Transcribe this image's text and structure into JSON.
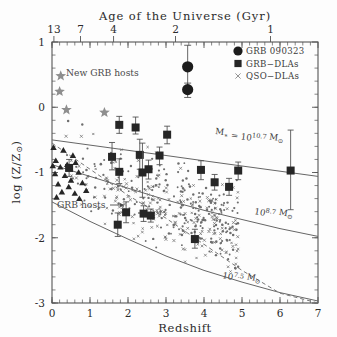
{
  "figure": {
    "top_axis_title": "Age of the Universe (Gyr)",
    "x_axis_label": "Redshift",
    "y_axis_label": "log (Z/Z",
    "y_axis_label_sub": "⊙",
    "y_axis_label_end": ")"
  },
  "legend": {
    "items": [
      {
        "marker": "filled-circle",
        "label": "GRB 090323"
      },
      {
        "marker": "filled-square",
        "label": "GRB−DLAs"
      },
      {
        "marker": "cross",
        "label": "QSO−DLAs"
      }
    ]
  },
  "annotations": [
    {
      "name": "new-grb-hosts-label",
      "text": "New GRB hosts",
      "x": 0.3,
      "y": 0.72
    },
    {
      "name": "grb-hosts-label",
      "text": "GRB hosts",
      "x": 0.1,
      "y": -1.5
    }
  ],
  "curve_labels": [
    {
      "name": "mass-curve-label-high",
      "text": "M",
      "sub": "∗",
      "eq": " = 10",
      "exp": "10.7",
      "unit": " M",
      "unit_sub": "⊙"
    },
    {
      "name": "mass-curve-label-mid",
      "text": "10",
      "exp": "8.7",
      "unit": " M",
      "unit_sub": "⊙"
    },
    {
      "name": "mass-curve-label-low",
      "text": "10",
      "exp": "7.5",
      "unit": " M",
      "unit_sub": "⊙"
    }
  ],
  "chart_data": {
    "type": "scatter",
    "title": "Age of the Universe (Gyr)",
    "xlabel": "Redshift",
    "ylabel": "log (Z/Z⊙)",
    "xlim": [
      0,
      7
    ],
    "ylim": [
      -3,
      1
    ],
    "xticks": [
      0,
      1,
      2,
      3,
      4,
      5,
      6,
      7
    ],
    "yticks": [
      1,
      0,
      -1,
      -2,
      -3
    ],
    "top_axis": {
      "label": "Age of the Universe (Gyr)",
      "ticks": [
        13,
        7,
        4,
        2,
        1
      ],
      "tick_redshift": [
        0.05,
        0.75,
        1.62,
        3.25,
        5.75
      ]
    },
    "grid": false,
    "legend_position": "top-right",
    "series": [
      {
        "name": "GRB 090323",
        "marker": "filled-circle",
        "color": "#1c1c1c",
        "points": [
          {
            "x": 3.57,
            "y": 0.62,
            "yerr_low": 0.3,
            "yerr_high": 0.33
          },
          {
            "x": 3.57,
            "y": 0.27,
            "yerr_low": 0.12,
            "yerr_high": 0.1
          }
        ]
      },
      {
        "name": "GRB−DLAs",
        "marker": "filled-square",
        "color": "#262626",
        "points": [
          {
            "x": 1.77,
            "y": -0.27,
            "yerr_low": 0.13,
            "yerr_high": 0.13
          },
          {
            "x": 2.2,
            "y": -0.31,
            "yerr_low": 0.1,
            "yerr_high": 0.16
          },
          {
            "x": 3.03,
            "y": -0.42,
            "yerr_low": 0.14,
            "yerr_high": 0.13
          },
          {
            "x": 1.58,
            "y": -0.76,
            "yerr_low": 0.2,
            "yerr_high": 0.22
          },
          {
            "x": 2.31,
            "y": -0.73,
            "yerr_low": 0.22,
            "yerr_high": 0.24
          },
          {
            "x": 2.83,
            "y": -0.74,
            "yerr_low": 0.14,
            "yerr_high": 0.13
          },
          {
            "x": 0.45,
            "y": -0.93,
            "yerr_low": 0.13,
            "yerr_high": 0.13
          },
          {
            "x": 1.77,
            "y": -0.99,
            "yerr_low": 0.18,
            "yerr_high": 0.2
          },
          {
            "x": 2.54,
            "y": -0.95,
            "yerr_low": 0.15,
            "yerr_high": 0.14
          },
          {
            "x": 3.92,
            "y": -0.96,
            "yerr_low": 0.15,
            "yerr_high": 0.14
          },
          {
            "x": 4.9,
            "y": -0.97,
            "yerr_low": 0.14,
            "yerr_high": 0.13
          },
          {
            "x": 2.38,
            "y": -1.0,
            "yerr_low": 0.38,
            "yerr_high": 0.45
          },
          {
            "x": 4.28,
            "y": -1.15,
            "yerr_low": 0.12,
            "yerr_high": 0.12
          },
          {
            "x": 4.66,
            "y": -1.22,
            "yerr_low": 0.13,
            "yerr_high": 0.13
          },
          {
            "x": 6.28,
            "y": -0.97,
            "yerr_low": 0.6,
            "yerr_high": 0.62
          },
          {
            "x": 1.95,
            "y": -1.61,
            "yerr_low": 0.16,
            "yerr_high": 0.16
          },
          {
            "x": 2.41,
            "y": -1.63,
            "yerr_low": 0.12,
            "yerr_high": 0.12
          },
          {
            "x": 1.73,
            "y": -1.8,
            "yerr_low": 0.18,
            "yerr_high": 0.18
          },
          {
            "x": 3.76,
            "y": -2.02,
            "yerr_low": 0.14,
            "yerr_high": 0.15
          },
          {
            "x": 2.6,
            "y": -1.66,
            "yerr_low": 0.1,
            "yerr_high": 0.1
          }
        ]
      },
      {
        "name": "New GRB hosts",
        "marker": "star",
        "color": "#8e8e8e",
        "points": [
          {
            "x": 0.23,
            "y": 0.48
          },
          {
            "x": 0.2,
            "y": 0.24
          },
          {
            "x": 0.38,
            "y": -0.04
          },
          {
            "x": 1.38,
            "y": -0.08
          }
        ]
      },
      {
        "name": "GRB hosts",
        "marker": "filled-triangle",
        "color": "#262626",
        "points": [
          {
            "x": 0.04,
            "y": -0.62
          },
          {
            "x": 0.3,
            "y": -0.66
          },
          {
            "x": 0.1,
            "y": -0.82
          },
          {
            "x": 0.55,
            "y": -0.74
          },
          {
            "x": 0.02,
            "y": -0.9
          },
          {
            "x": 0.22,
            "y": -0.92
          },
          {
            "x": 0.4,
            "y": -0.88
          },
          {
            "x": 0.62,
            "y": -0.85
          },
          {
            "x": 0.08,
            "y": -1.02
          },
          {
            "x": 0.34,
            "y": -1.05
          },
          {
            "x": 0.7,
            "y": -1.0
          },
          {
            "x": 0.5,
            "y": -1.12
          },
          {
            "x": 0.16,
            "y": -1.18
          },
          {
            "x": 0.44,
            "y": -1.22
          },
          {
            "x": 0.8,
            "y": -1.16
          },
          {
            "x": 0.26,
            "y": -1.3
          },
          {
            "x": 0.6,
            "y": -1.32
          },
          {
            "x": 0.9,
            "y": -1.28
          },
          {
            "x": 0.12,
            "y": -1.38
          },
          {
            "x": 0.72,
            "y": -1.4
          }
        ]
      },
      {
        "name": "QSO−DLAs",
        "marker": "cross",
        "color": "#707070",
        "note": "dense background scatter of small crosses"
      }
    ],
    "curves": [
      {
        "name": "M* = 10^10.7 Msun",
        "style": "solid",
        "label": "M∗ = 10^{10.7} M⊙",
        "points": [
          [
            0,
            -0.5
          ],
          [
            1,
            -0.58
          ],
          [
            2,
            -0.66
          ],
          [
            3,
            -0.74
          ],
          [
            4,
            -0.82
          ],
          [
            5,
            -0.9
          ],
          [
            6,
            -0.98
          ],
          [
            7,
            -1.06
          ]
        ]
      },
      {
        "name": "M* = 10^8.7 Msun",
        "style": "solid",
        "label": "10^{8.7} M⊙",
        "points": [
          [
            0,
            -0.88
          ],
          [
            1,
            -1.06
          ],
          [
            2,
            -1.24
          ],
          [
            3,
            -1.42
          ],
          [
            4,
            -1.58
          ],
          [
            5,
            -1.72
          ],
          [
            6,
            -1.86
          ],
          [
            7,
            -1.98
          ]
        ]
      },
      {
        "name": "M* = 10^7.5 Msun",
        "style": "solid",
        "label": "10^{7.5} M⊙",
        "points": [
          [
            0,
            -1.45
          ],
          [
            1,
            -1.75
          ],
          [
            2,
            -2.02
          ],
          [
            3,
            -2.28
          ],
          [
            4,
            -2.5
          ],
          [
            5,
            -2.68
          ],
          [
            6,
            -2.84
          ],
          [
            7,
            -2.97
          ]
        ]
      },
      {
        "name": "detection-limit",
        "style": "dashed",
        "label": "",
        "points": [
          [
            0,
            -0.55
          ],
          [
            1,
            -0.95
          ],
          [
            2,
            -1.35
          ],
          [
            3,
            -1.7
          ],
          [
            4,
            -2.1
          ],
          [
            5,
            -2.5
          ],
          [
            6,
            -2.85
          ],
          [
            7,
            -3.0
          ]
        ]
      }
    ]
  }
}
